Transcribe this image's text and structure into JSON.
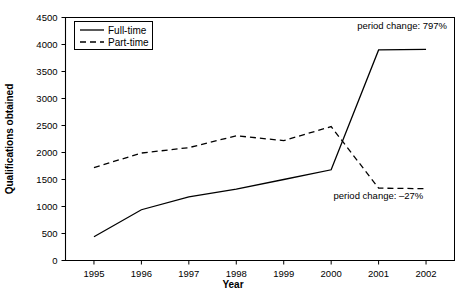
{
  "chart_data": {
    "type": "line",
    "title": "",
    "xlabel": "Year",
    "ylabel": "Qualifications obtained",
    "categories": [
      "1995",
      "1996",
      "1997",
      "1998",
      "1999",
      "2000",
      "2001",
      "2002"
    ],
    "x": [
      1995,
      1996,
      1997,
      1998,
      1999,
      2000,
      2001,
      2002
    ],
    "xlim": [
      1994.4,
      2002.6
    ],
    "ylim": [
      0,
      4500
    ],
    "yticks": [
      0,
      500,
      1000,
      1500,
      2000,
      2500,
      3000,
      3500,
      4000,
      4500
    ],
    "ytick_labels": [
      "0",
      "500",
      "1000",
      "1500",
      "2000",
      "2500",
      "3000",
      "3500",
      "4000",
      "4500"
    ],
    "grid": false,
    "legend_position": "top-left",
    "series": [
      {
        "name": "Full-time",
        "style": "solid",
        "values": [
          440,
          940,
          1180,
          1320,
          1500,
          1680,
          3900,
          3910
        ]
      },
      {
        "name": "Part-time",
        "style": "dashed",
        "values": [
          1720,
          1990,
          2090,
          2310,
          2220,
          2480,
          1340,
          1330
        ]
      }
    ],
    "annotations": [
      {
        "text": "period change: 797%",
        "x": 2000.55,
        "y": 4280,
        "anchor": "start"
      },
      {
        "text": "period change: –27%",
        "x": 2000.05,
        "y": 1130,
        "anchor": "start"
      }
    ]
  }
}
